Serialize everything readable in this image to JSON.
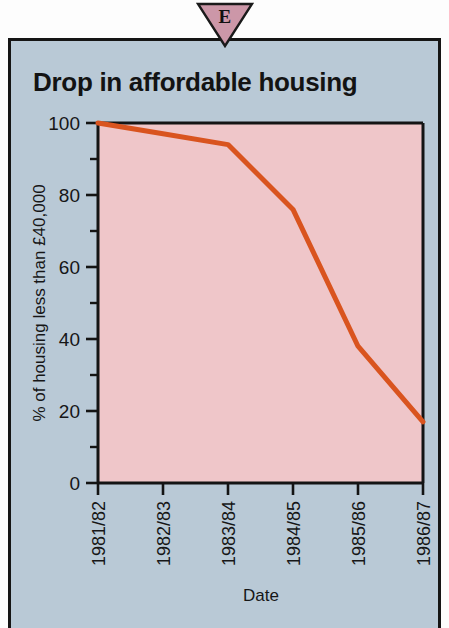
{
  "badge": {
    "letter": "E",
    "shape": "down-triangle",
    "fill": "#cc97a8",
    "stroke": "#1a1a1a"
  },
  "panel": {
    "background": "#b9c9d6",
    "border_color": "#151515"
  },
  "chart_data": {
    "type": "line",
    "title": "Drop in affordable housing",
    "xlabel": "Date",
    "ylabel": "% of housing less than £40,000",
    "categories": [
      "1981/82",
      "1982/83",
      "1983/84",
      "1984/85",
      "1985/86",
      "1986/87"
    ],
    "series": [
      {
        "name": "% of housing less than £40,000",
        "values": [
          100,
          97,
          94,
          76,
          38,
          17
        ],
        "color": "#d9541f"
      }
    ],
    "ylim": [
      0,
      100
    ],
    "yticks": [
      0,
      20,
      40,
      60,
      80,
      100
    ],
    "yticklabels": [
      "0",
      "20",
      "40",
      "60",
      "80",
      "100"
    ],
    "yminorticks": [
      10,
      30,
      50,
      70,
      90
    ],
    "grid": false,
    "legend": "none",
    "plot_background": "#efc6c9",
    "axis_color": "#141414"
  }
}
